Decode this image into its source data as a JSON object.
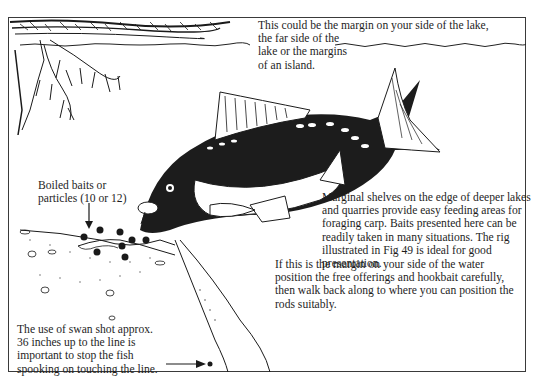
{
  "diagram": {
    "type": "illustration",
    "annotations": {
      "top": "This could be the margin on your side of the lake,\nthe far side of the\nlake or the margins\nof an island.",
      "baits": "Boiled baits or\nparticles (10 or 12)",
      "shelves": "Marginal shelves on the edge of deeper lakes\nand quarries provide easy feeding areas for\nforaging carp. Baits presented here can be\nreadily taken in many situations. The rig\nillustrated in Fig 49 is ideal for good\npresentation.",
      "margin": "If this is the margin on your side of the water\nposition the free offerings and hookbait carefully,\nthen walk back along to where you can position the\nrods suitably.",
      "shot": "The use of swan shot approx.\n36 inches up to the line is\nimportant to stop the fish\nspooking on touching the line."
    },
    "elements": [
      "tree-overhang",
      "water-surface",
      "carp",
      "lake-bed",
      "marginal-shelf",
      "baits",
      "fishing-line",
      "swan-shot"
    ],
    "colors": {
      "ink": "#1a1a1a",
      "paper": "#ffffff",
      "frame": "#3a3a3a"
    }
  }
}
